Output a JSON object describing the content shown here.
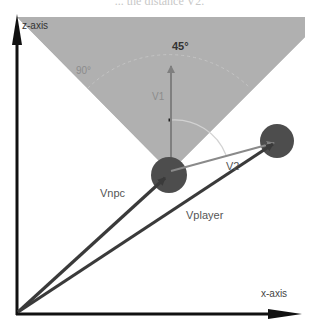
{
  "caption": "... the distance V2.",
  "colors": {
    "cone": "#b0b0b0",
    "axes": "#111111",
    "vector_dark": "#3a3a3a",
    "vector_light": "#8a8a8a",
    "npc": "#4d4d4d",
    "player": "#4d4d4d",
    "arc": "#cfcfcf"
  },
  "axes": {
    "z_label": "z-axis",
    "x_label": "x-axis"
  },
  "angles": {
    "fov_half": "45°",
    "fov_side": "90°"
  },
  "vectors": {
    "v1": "V1",
    "v2": "V2",
    "vnpc": "Vnpc",
    "vplayer": "Vplayer"
  }
}
